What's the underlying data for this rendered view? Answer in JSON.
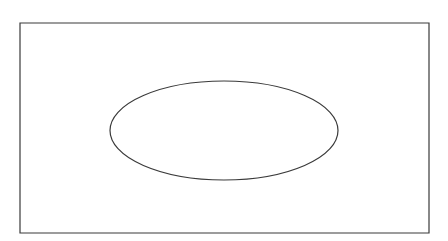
{
  "figure": {
    "domain": "Diagram",
    "canvas": {
      "width": 448,
      "height": 241,
      "background_color": "#ffffff"
    },
    "shapes": [
      {
        "id": "bounding-rectangle",
        "name": "rectangle-outline",
        "type": "rect",
        "x": 20,
        "y": 23,
        "width": 409,
        "height": 210,
        "fill": "none",
        "stroke_color": "#3a3a3a",
        "stroke_width": 1.2
      },
      {
        "id": "inner-ellipse",
        "name": "ellipse-outline",
        "type": "ellipse",
        "cx": 224,
        "cy": 130.5,
        "rx": 114,
        "ry": 49.5,
        "fill": "none",
        "stroke_color": "#3a3a3a",
        "stroke_width": 1.2
      }
    ]
  }
}
